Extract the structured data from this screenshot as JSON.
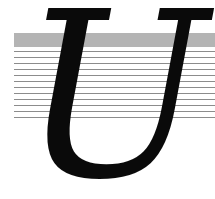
{
  "graphic": {
    "letter": "U",
    "band_color": "#b4b4b4",
    "line_color": "#8c8c8c",
    "line_count": 12,
    "letter_color": "#0a0a0a"
  }
}
